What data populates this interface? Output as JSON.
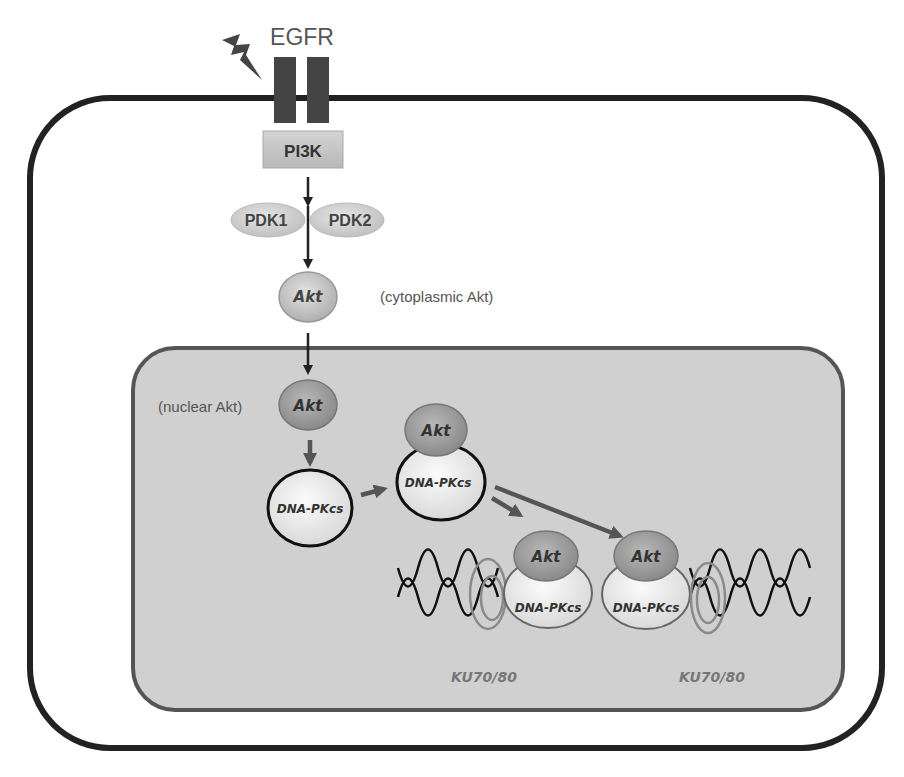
{
  "diagram": {
    "receptor": {
      "label": "EGFR",
      "stimulus_icon": "lightning-bolt"
    },
    "pi3k": {
      "label": "PI3K"
    },
    "pdk": {
      "left_label": "PDK1",
      "right_label": "PDK2"
    },
    "cytoplasmic_akt": {
      "node_label": "Akt",
      "annotation": "(cytoplasmic Akt)"
    },
    "nuclear_akt": {
      "node_label": "Akt",
      "annotation": "(nuclear Akt)"
    },
    "dna_pkcs_free": {
      "label": "DNA-PKcs"
    },
    "complex_center": {
      "akt_label": "Akt",
      "dna_pkcs_label": "DNA-PKcs"
    },
    "complex_left": {
      "akt_label": "Akt",
      "dna_pkcs_label": "DNA-PKcs",
      "ku_label": "KU70/80"
    },
    "complex_right": {
      "akt_label": "Akt",
      "dna_pkcs_label": "DNA-PKcs",
      "ku_label": "KU70/80"
    },
    "colors": {
      "membrane": "#222222",
      "receptor": "#444444",
      "pi3k_fill": "#c8c8c8",
      "nucleus_fill": "#d0d0d0",
      "nucleus_border": "#555555",
      "akt_fill": "#9a9a9a",
      "dna_pkcs_fill": "#eeeeee",
      "ku_ring": "#8a8a8a",
      "arrow_dark": "#222222",
      "arrow_gray": "#555555"
    }
  }
}
